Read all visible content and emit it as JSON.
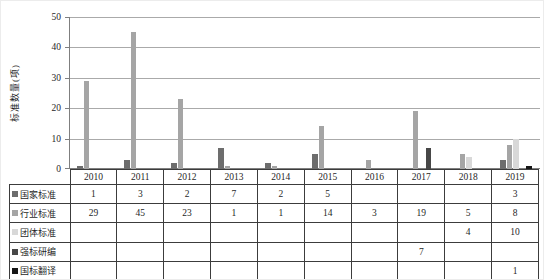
{
  "chart_data": {
    "type": "bar",
    "title": "",
    "xlabel": "",
    "ylabel": "标准数量(项)",
    "categories": [
      "2010",
      "2011",
      "2012",
      "2013",
      "2014",
      "2015",
      "2016",
      "2017",
      "2018",
      "2019"
    ],
    "series": [
      {
        "name": "国家标准",
        "color": "#6d6d6d",
        "values": [
          1,
          3,
          2,
          7,
          2,
          5,
          null,
          null,
          null,
          3
        ]
      },
      {
        "name": "行业标准",
        "color": "#a5a5a5",
        "values": [
          29,
          45,
          23,
          1,
          1,
          14,
          3,
          19,
          5,
          8
        ]
      },
      {
        "name": "团体标准",
        "color": "#d8d8d8",
        "values": [
          null,
          null,
          null,
          null,
          null,
          null,
          null,
          null,
          4,
          10
        ]
      },
      {
        "name": "强标研编",
        "color": "#474747",
        "values": [
          null,
          null,
          null,
          null,
          null,
          null,
          null,
          7,
          null,
          null
        ]
      },
      {
        "name": "国标翻译",
        "color": "#161616",
        "values": [
          null,
          null,
          null,
          null,
          null,
          null,
          null,
          null,
          null,
          1
        ]
      }
    ],
    "ylim": [
      0,
      50
    ],
    "yticks": [
      0,
      10,
      20,
      30,
      40,
      50
    ],
    "grid": true,
    "legend_position": "table-left",
    "gridline_color": "#aaaaaa",
    "axis_color": "#7f7f7f"
  }
}
